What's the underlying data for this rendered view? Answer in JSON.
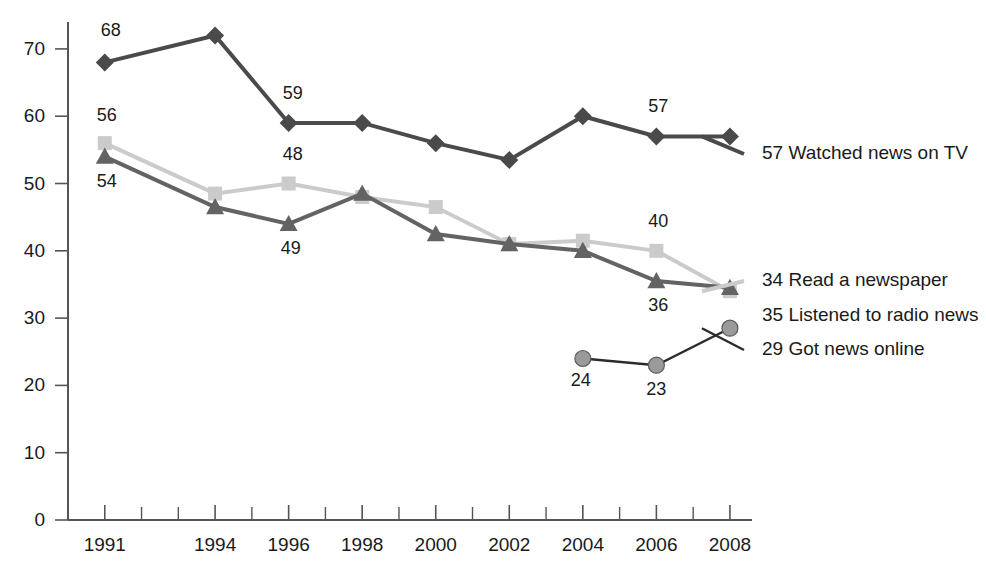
{
  "chart_data": {
    "type": "line",
    "title": "",
    "subtitle": "",
    "xlabel": "",
    "ylabel": "",
    "xlim": [
      1990,
      2008.6
    ],
    "ylim": [
      0,
      74
    ],
    "grid": false,
    "legend_position": "right-inline",
    "x": [
      1991,
      1994,
      1996,
      1998,
      2000,
      2002,
      2004,
      2006,
      2008
    ],
    "ytick_labels": [
      "0",
      "10",
      "20",
      "30",
      "40",
      "50",
      "60",
      "70"
    ],
    "ytick_values": [
      0,
      10,
      20,
      30,
      40,
      50,
      60,
      70
    ],
    "xtick_labels": [
      "1991",
      "1994",
      "1996",
      "1998",
      "2000",
      "2002",
      "2004",
      "2006",
      "2008"
    ],
    "xtick_values": [
      1991,
      1994,
      1996,
      1998,
      2000,
      2002,
      2004,
      2006,
      2008
    ],
    "xtick_minor_values": [
      1990,
      1992,
      1993,
      1995,
      1997,
      1999,
      2001,
      2003,
      2005,
      2007
    ],
    "series": [
      {
        "name": "Watched news on TV",
        "marker": "diamond",
        "color": "#4a4a4a",
        "line_color": "#4a4a4a",
        "x": [
          1991,
          1994,
          1996,
          1998,
          2000,
          2002,
          2004,
          2006,
          2008
        ],
        "values": [
          68,
          72,
          59,
          59,
          56,
          53.5,
          60,
          57,
          57
        ],
        "end_value": 57,
        "legend_text": "57 Watched news on TV",
        "annotations": [
          {
            "x": 1991,
            "value": 68,
            "text": "68",
            "dx": 6,
            "dy": -26
          },
          {
            "x": 1996,
            "value": 59,
            "text": "59",
            "dx": 4,
            "dy": -24
          },
          {
            "x": 2006,
            "value": 57,
            "text": "57",
            "dx": 2,
            "dy": -24
          }
        ]
      },
      {
        "name": "Read a newspaper",
        "marker": "square",
        "color": "#cbcbcb",
        "line_color": "#cbcbcb",
        "x": [
          1991,
          1994,
          1996,
          1998,
          2000,
          2002,
          2004,
          2006,
          2008
        ],
        "values": [
          56,
          48.5,
          50,
          48,
          46.5,
          41,
          41.5,
          40,
          34
        ],
        "end_value": 34,
        "legend_text": "34 Read a newspaper",
        "annotations": [
          {
            "x": 1991,
            "value": 56,
            "text": "56",
            "dx": 2,
            "dy": -22
          },
          {
            "x": 1996,
            "value": 50,
            "text": "48",
            "dx": 4,
            "dy": -24
          },
          {
            "x": 2006,
            "value": 40,
            "text": "40",
            "dx": 2,
            "dy": -24
          }
        ]
      },
      {
        "name": "Listened to radio news",
        "marker": "triangle",
        "color": "#636363",
        "line_color": "#636363",
        "x": [
          1991,
          1994,
          1996,
          1998,
          2000,
          2002,
          2004,
          2006,
          2008
        ],
        "values": [
          54,
          46.5,
          44,
          48.5,
          42.5,
          41,
          40,
          35.5,
          34.5
        ],
        "end_value": 35,
        "legend_text": "35 Listened to radio news",
        "annotations": [
          {
            "x": 1991,
            "value": 54,
            "text": "54",
            "dx": 2,
            "dy": 30
          },
          {
            "x": 1996,
            "value": 44,
            "text": "49",
            "dx": 2,
            "dy": 30
          },
          {
            "x": 2006,
            "value": 35.5,
            "text": "36",
            "dx": 2,
            "dy": 30
          }
        ]
      },
      {
        "name": "Got news online",
        "marker": "circle",
        "color": "#9a9a9a",
        "line_color": "#2b2b2b",
        "x": [
          2004,
          2006,
          2008
        ],
        "values": [
          24,
          23,
          28.5
        ],
        "end_value": 29,
        "legend_text": "29 Got news online",
        "annotations": [
          {
            "x": 2004,
            "value": 24,
            "text": "24",
            "dx": -2,
            "dy": 28
          },
          {
            "x": 2006,
            "value": 23,
            "text": "23",
            "dx": 0,
            "dy": 30
          }
        ]
      }
    ]
  },
  "legend": {
    "entries": [
      {
        "label": "57 Watched news on TV"
      },
      {
        "label": "35 Listened to radio news"
      },
      {
        "label": "34 Read a newspaper"
      },
      {
        "label": "29 Got news online"
      }
    ]
  }
}
